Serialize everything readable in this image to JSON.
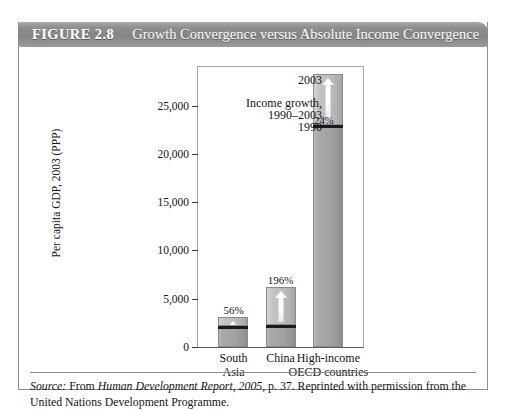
{
  "figure": {
    "number_label": "FIGURE 2.8",
    "title": "Growth Convergence versus Absolute Income Convergence"
  },
  "source": {
    "prefix": "Source:",
    "from": "From",
    "publication": "Human Development Report, 2005,",
    "rest": "p. 37. Reprinted with permission from the United Nations Development Programme."
  },
  "annotations": {
    "year_top": "2003",
    "growth_line1": "Income growth,",
    "growth_line2": "1990–2003",
    "year_bottom": "1990"
  },
  "chart_data": {
    "type": "bar",
    "title": "Growth Convergence versus Absolute Income Convergence",
    "xlabel": "",
    "ylabel": "Per capita GDP, 2003 (PPP)",
    "ylim": [
      0,
      29000
    ],
    "ytick_values": [
      0,
      5000,
      10000,
      15000,
      20000,
      25000
    ],
    "ytick_labels": [
      "0",
      "5,000",
      "10,000",
      "15,000",
      "20,000",
      "25,000"
    ],
    "grid": false,
    "legend": false,
    "categories": [
      "South Asia",
      "China",
      "High-income OECD countries"
    ],
    "category_lines": [
      [
        "South",
        "Asia"
      ],
      [
        "China"
      ],
      [
        "High-income",
        "OECD countries"
      ]
    ],
    "series": [
      {
        "name": "1990 per capita GDP",
        "values": [
          2000,
          2100,
          22800
        ]
      },
      {
        "name": "Income growth, 1990–2003",
        "values": [
          1120,
          4116,
          5472
        ]
      }
    ],
    "totals_2003": [
      3120,
      6216,
      28272
    ],
    "growth_labels": [
      "56%",
      "196%",
      "24%"
    ],
    "annotations": [
      "2003",
      "Income growth, 1990–2003",
      "1990"
    ]
  }
}
